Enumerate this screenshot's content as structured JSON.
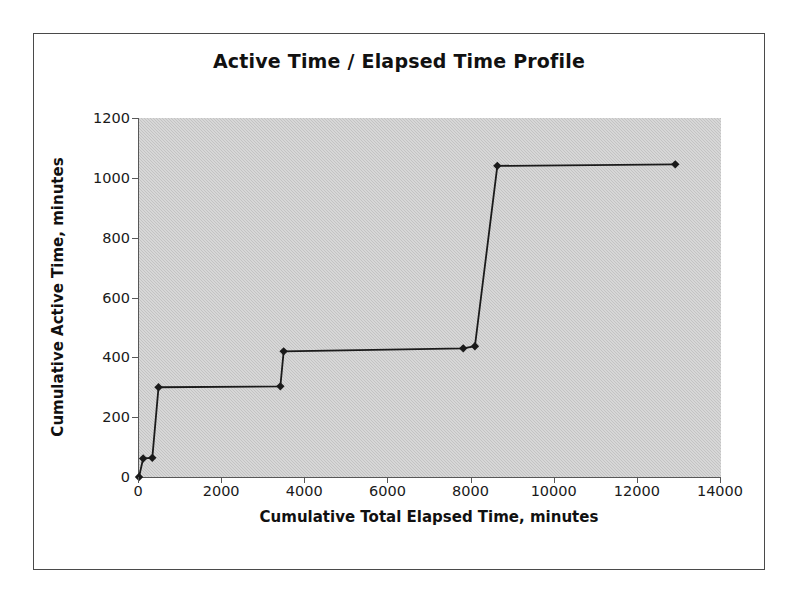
{
  "chart_data": {
    "type": "line",
    "title": "Active Time / Elapsed Time Profile",
    "xlabel": "Cumulative Total Elapsed Time, minutes",
    "ylabel": "Cumulative Active Time, minutes",
    "xlim": [
      0,
      14000
    ],
    "ylim": [
      0,
      1200
    ],
    "xticks": [
      0,
      2000,
      4000,
      6000,
      8000,
      10000,
      12000,
      14000
    ],
    "xtick_labels": [
      "0",
      "2000",
      "4000",
      "6000",
      "8000",
      "10000",
      "12000",
      "14000"
    ],
    "yticks": [
      0,
      200,
      400,
      600,
      800,
      1000,
      1200
    ],
    "ytick_labels": [
      "0",
      "200",
      "400",
      "600",
      "800",
      "1000",
      "1200"
    ],
    "grid": false,
    "legend": "none",
    "plot_background": "#c3c3c3",
    "series_color": "#1a1a1a",
    "marker": "diamond",
    "series": [
      {
        "name": "Cumulative Active Time",
        "points": [
          {
            "x": 0,
            "y": 0
          },
          {
            "x": 100,
            "y": 62
          },
          {
            "x": 320,
            "y": 64
          },
          {
            "x": 470,
            "y": 300
          },
          {
            "x": 3400,
            "y": 303
          },
          {
            "x": 3480,
            "y": 420
          },
          {
            "x": 7800,
            "y": 430
          },
          {
            "x": 8080,
            "y": 437
          },
          {
            "x": 8620,
            "y": 1040
          },
          {
            "x": 12900,
            "y": 1045
          }
        ]
      }
    ]
  }
}
